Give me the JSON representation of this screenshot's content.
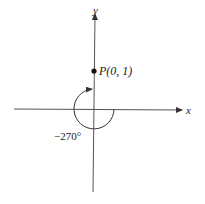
{
  "diagram": {
    "axes": {
      "x_label": "x",
      "y_label": "y",
      "axis_color": "#444444"
    },
    "point": {
      "label": "P(0, 1)",
      "coords": [
        0,
        1
      ]
    },
    "angle": {
      "label": "−270°",
      "degrees": -270,
      "direction": "clockwise"
    }
  }
}
